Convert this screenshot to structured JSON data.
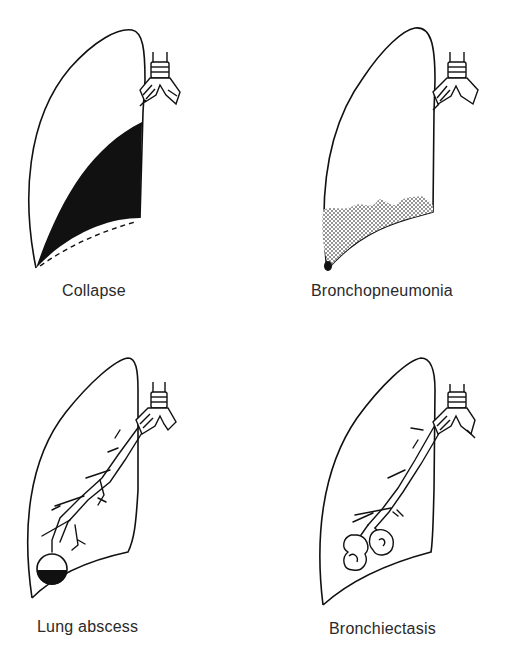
{
  "figure": {
    "panels": [
      {
        "id": "collapse",
        "label": "Collapse"
      },
      {
        "id": "bronchopneumonia",
        "label": "Bronchopneumonia"
      },
      {
        "id": "lung-abscess",
        "label": "Lung abscess"
      },
      {
        "id": "bronchiectasis",
        "label": "Bronchiectasis"
      }
    ]
  },
  "colors": {
    "ink": "#111111",
    "label": "#2a2a2a",
    "background": "#ffffff"
  }
}
